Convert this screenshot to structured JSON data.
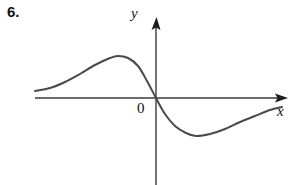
{
  "figure": {
    "problem_number": "6.",
    "origin_label": "0",
    "x_axis_label": "x",
    "y_axis_label": "y",
    "colors": {
      "background": "#ffffff",
      "axis": "#3a3a3a",
      "curve": "#4a4a4a",
      "text": "#111111"
    }
  },
  "chart_data": {
    "type": "line",
    "title": "",
    "subtitle": "",
    "xlabel": "x",
    "ylabel": "y",
    "grid": false,
    "legend": null,
    "annotations": [
      "0"
    ],
    "axes": {
      "origin_px": [
        156,
        98
      ],
      "x_axis_px": {
        "from": [
          35,
          98
        ],
        "to": [
          288,
          98
        ],
        "arrow": "right"
      },
      "y_axis_px": {
        "from": [
          156,
          185
        ],
        "to": [
          156,
          17
        ],
        "arrow": "up"
      }
    },
    "features": {
      "local_maximum_px": [
        118,
        56
      ],
      "x_intercept_px": [
        156,
        98
      ],
      "local_minimum_px": [
        196,
        136
      ],
      "left_endpoint_px": [
        35,
        91
      ],
      "right_endpoint_px": [
        282,
        107
      ]
    },
    "points_px": [
      [
        35,
        91
      ],
      [
        50,
        88
      ],
      [
        65,
        82
      ],
      [
        80,
        74
      ],
      [
        95,
        65
      ],
      [
        110,
        58
      ],
      [
        118,
        56
      ],
      [
        128,
        58
      ],
      [
        138,
        66
      ],
      [
        147,
        81
      ],
      [
        156,
        98
      ],
      [
        165,
        114
      ],
      [
        175,
        126
      ],
      [
        186,
        133
      ],
      [
        196,
        136
      ],
      [
        210,
        134
      ],
      [
        225,
        129
      ],
      [
        240,
        122
      ],
      [
        255,
        116
      ],
      [
        270,
        110
      ],
      [
        282,
        107
      ]
    ],
    "x": [
      -6.05,
      -5.3,
      -4.55,
      -3.8,
      -3.05,
      -2.3,
      -1.9,
      -1.4,
      -0.9,
      -0.45,
      0,
      0.45,
      0.95,
      1.5,
      2,
      2.7,
      3.45,
      4.2,
      4.95,
      5.7,
      6.3
    ],
    "y": [
      0.175,
      0.25,
      0.4,
      0.6,
      0.825,
      1,
      1.05,
      1,
      0.8,
      0.425,
      0,
      -0.4,
      -0.7,
      -0.875,
      -0.95,
      -0.9,
      -0.775,
      -0.6,
      -0.45,
      -0.3,
      -0.225
    ],
    "xlim": [
      -6.5,
      7
    ],
    "ylim": [
      -2.2,
      2
    ]
  }
}
